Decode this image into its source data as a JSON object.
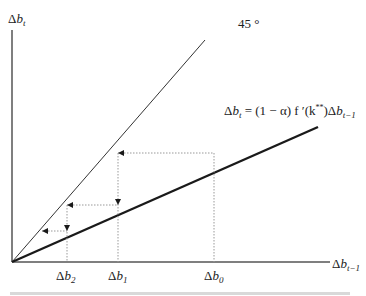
{
  "diagram": {
    "y_axis_label": {
      "sym": "Δ",
      "var": "b",
      "sub": "t"
    },
    "x_axis_label": {
      "sym": "Δ",
      "var": "b",
      "sub": "t−1"
    },
    "line_45_label": "45 °",
    "equation": {
      "lhs_sym": "Δ",
      "lhs_var": "b",
      "lhs_sub": "t",
      "rhs": " = (1 − α) f ′(k",
      "sup": "**",
      "rhs_end": ")Δ",
      "end_var": "b",
      "end_sub": "t−1"
    },
    "x_ticks": [
      {
        "sym": "Δ",
        "var": "b",
        "sub": "2"
      },
      {
        "sym": "Δ",
        "var": "b",
        "sub": "1"
      },
      {
        "sym": "Δ",
        "var": "b",
        "sub": "0"
      }
    ],
    "colors": {
      "axis": "#555555",
      "line_45": "#333333",
      "line_bold": "#1a1a1a",
      "dotted": "#999999"
    }
  }
}
